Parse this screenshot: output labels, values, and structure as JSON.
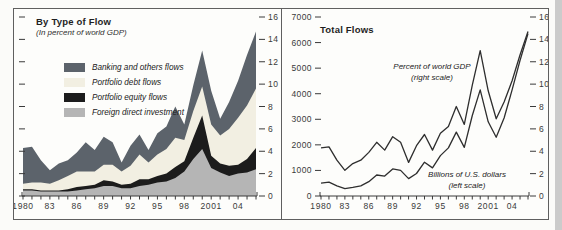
{
  "left_panel": {
    "title": "By Type of Flow",
    "subtitle": "(In percent of world GDP)",
    "legend": [
      {
        "label": "Banking and others flows",
        "color": "#5c636b"
      },
      {
        "label": "Portfolio debt flows",
        "color": "#f2efe2"
      },
      {
        "label": "Portfolio equity flows",
        "color": "#1c1c1c"
      },
      {
        "label": "Foreign direct investment",
        "color": "#b5b5b5"
      }
    ]
  },
  "right_panel": {
    "title": "Total Flows",
    "annotation_gdp": {
      "line1": "Percent of world GDP",
      "line2": "(right scale)"
    },
    "annotation_usd": {
      "line1": "Billions of U.S. dollars",
      "line2": "(left scale)"
    }
  },
  "chart_data": [
    {
      "type": "area",
      "stacked": true,
      "title": "By Type of Flow (In percent of world GDP)",
      "x": [
        1980,
        1981,
        1982,
        1983,
        1984,
        1985,
        1986,
        1987,
        1988,
        1989,
        1990,
        1991,
        1992,
        1993,
        1994,
        1995,
        1996,
        1997,
        1998,
        1999,
        2000,
        2001,
        2002,
        2003,
        2004,
        2005,
        2006
      ],
      "series": [
        {
          "name": "Foreign direct investment",
          "color": "#b5b5b5",
          "values": [
            0.5,
            0.5,
            0.4,
            0.4,
            0.4,
            0.4,
            0.5,
            0.6,
            0.7,
            0.9,
            0.9,
            0.7,
            0.7,
            0.9,
            1.0,
            1.2,
            1.3,
            1.6,
            2.2,
            3.3,
            4.2,
            2.5,
            2.1,
            1.8,
            2.0,
            2.1,
            2.4
          ]
        },
        {
          "name": "Portfolio equity flows",
          "color": "#1c1c1c",
          "values": [
            0.1,
            0.1,
            0.1,
            0.1,
            0.1,
            0.2,
            0.3,
            0.3,
            0.3,
            0.5,
            0.4,
            0.3,
            0.4,
            0.6,
            0.5,
            0.6,
            0.7,
            1.0,
            0.9,
            1.9,
            3.0,
            1.1,
            0.8,
            0.9,
            0.8,
            1.2,
            1.9
          ]
        },
        {
          "name": "Portfolio debt flows",
          "color": "#f2efe2",
          "values": [
            0.5,
            0.6,
            0.7,
            0.6,
            0.9,
            1.2,
            1.4,
            1.3,
            1.2,
            1.4,
            1.5,
            1.2,
            1.6,
            2.2,
            1.5,
            1.9,
            2.2,
            2.6,
            1.9,
            2.4,
            2.6,
            2.8,
            2.5,
            3.3,
            4.2,
            4.8,
            5.3
          ]
        },
        {
          "name": "Banking and others flows",
          "color": "#5c636b",
          "values": [
            3.2,
            3.2,
            2.0,
            1.2,
            1.5,
            1.4,
            1.7,
            2.6,
            1.9,
            2.5,
            2.0,
            0.8,
            1.8,
            1.8,
            1.1,
            1.9,
            2.0,
            2.8,
            1.4,
            2.3,
            3.2,
            3.0,
            1.5,
            2.4,
            3.3,
            4.5,
            5.1
          ]
        }
      ],
      "yaxis": {
        "side": "right",
        "min": 0,
        "max": 16,
        "ticks": [
          0,
          2,
          4,
          6,
          8,
          10,
          12,
          14,
          16
        ]
      },
      "xaxis": {
        "tick_labels": [
          [
            1980,
            "1980"
          ],
          [
            1983,
            "83"
          ],
          [
            1986,
            "86"
          ],
          [
            1989,
            "89"
          ],
          [
            1992,
            "92"
          ],
          [
            1995,
            "95"
          ],
          [
            1998,
            "98"
          ],
          [
            2001,
            "2001"
          ],
          [
            2004,
            "04"
          ]
        ]
      }
    },
    {
      "type": "line",
      "title": "Total Flows",
      "x": [
        1980,
        1981,
        1982,
        1983,
        1984,
        1985,
        1986,
        1987,
        1988,
        1989,
        1990,
        1991,
        1992,
        1993,
        1994,
        1995,
        1996,
        1997,
        1998,
        1999,
        2000,
        2001,
        2002,
        2003,
        2004,
        2005,
        2006
      ],
      "series": [
        {
          "name": "Billions of U.S. dollars",
          "axis": "left",
          "color": "#2e2e2e",
          "values": [
            500,
            540,
            400,
            290,
            340,
            400,
            560,
            820,
            780,
            1060,
            1000,
            680,
            880,
            1320,
            1100,
            1580,
            1880,
            2500,
            1900,
            3150,
            4150,
            2900,
            2300,
            3050,
            4150,
            5300,
            6350
          ]
        },
        {
          "name": "Percent of world GDP",
          "axis": "right",
          "color": "#2e2e2e",
          "values": [
            4.3,
            4.4,
            3.2,
            2.3,
            2.9,
            3.2,
            3.9,
            4.8,
            4.1,
            5.3,
            4.8,
            3.0,
            4.5,
            5.5,
            4.1,
            5.6,
            6.2,
            8.0,
            6.4,
            9.9,
            13.0,
            9.4,
            6.9,
            8.4,
            10.3,
            12.6,
            14.7
          ]
        }
      ],
      "left_axis": {
        "min": 0,
        "max": 7000,
        "ticks": [
          0,
          1000,
          2000,
          3000,
          4000,
          5000,
          6000,
          7000
        ]
      },
      "right_axis": {
        "min": 0,
        "max": 16,
        "ticks": [
          0,
          2,
          4,
          6,
          8,
          10,
          12,
          14,
          16
        ]
      }
    }
  ]
}
